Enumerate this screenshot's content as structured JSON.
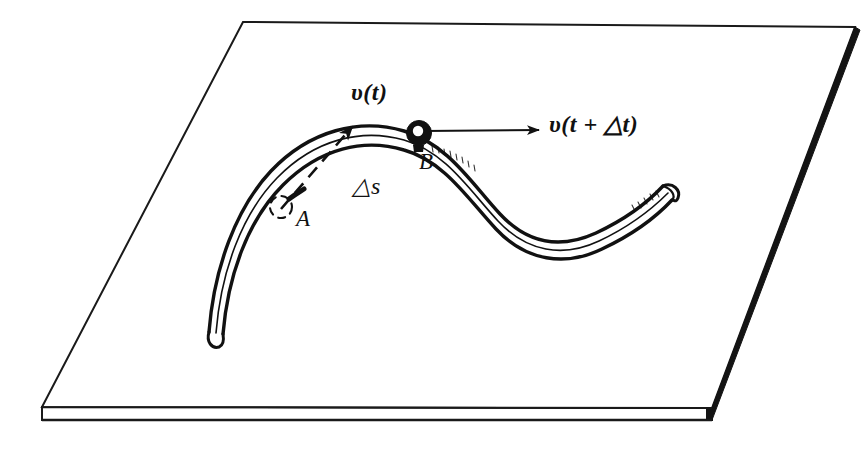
{
  "figure": {
    "ink_color": "#111111",
    "surface_color": "#ffffff",
    "edge_color": "#1a1a1a"
  },
  "labels": {
    "velocity_at_t": "υ(t)",
    "velocity_at_t_plus_dt": "υ(t + △t)",
    "arc_length": "△s",
    "point_a": "A",
    "point_b": "B"
  },
  "markers": {
    "point_a_style": "open-dashed-circle",
    "point_b_style": "filled-ring"
  },
  "vectors": [
    {
      "name": "velocity_at_t",
      "style": "dashed",
      "from": "A",
      "angle_deg": 42
    },
    {
      "name": "velocity_at_t_plus_dt",
      "style": "solid",
      "from": "B",
      "angle_deg": 0
    }
  ],
  "icons": {
    "plane": "plane-slab-icon",
    "track": "curved-track-icon",
    "arrow_dashed": "dashed-arrow-icon",
    "arrow_solid": "solid-arrow-icon"
  }
}
